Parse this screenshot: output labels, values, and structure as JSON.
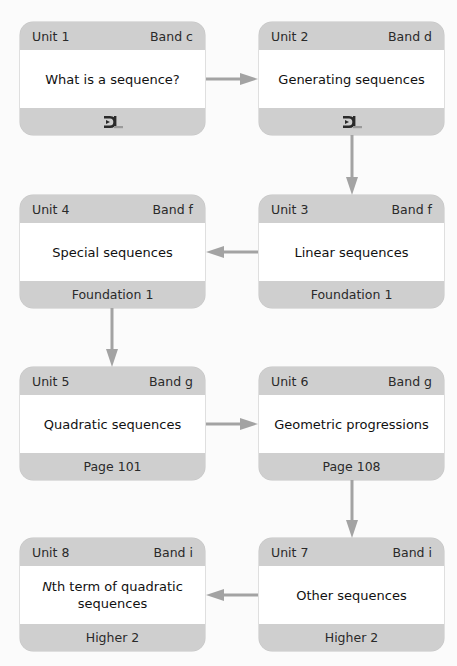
{
  "colors": {
    "box_band": "#cfcfcf",
    "box_body": "#ffffff",
    "arrow": "#a3a3a3",
    "background": "#fbfbfb"
  },
  "units": [
    {
      "unit": "Unit 1",
      "band": "Band c",
      "title": "What is a sequence?",
      "footer_icon": "dl-logo-icon"
    },
    {
      "unit": "Unit 2",
      "band": "Band d",
      "title": "Generating sequences",
      "footer_icon": "dl-logo-icon"
    },
    {
      "unit": "Unit 3",
      "band": "Band f",
      "title": "Linear sequences",
      "footer": "Foundation 1"
    },
    {
      "unit": "Unit 4",
      "band": "Band f",
      "title": "Special sequences",
      "footer": "Foundation 1"
    },
    {
      "unit": "Unit 5",
      "band": "Band g",
      "title": "Quadratic sequences",
      "footer": "Page 101"
    },
    {
      "unit": "Unit 6",
      "band": "Band g",
      "title": "Geometric progressions",
      "footer": "Page 108"
    },
    {
      "unit": "Unit 7",
      "band": "Band i",
      "title": "Other sequences",
      "footer": "Higher 2"
    },
    {
      "unit": "Unit 8",
      "band": "Band i",
      "title_italic": "N",
      "title_rest": "th term of quadratic sequences",
      "footer": "Higher 2"
    }
  ],
  "flow": [
    "Unit 1 → Unit 2",
    "Unit 2 → Unit 3",
    "Unit 3 → Unit 4",
    "Unit 4 → Unit 5",
    "Unit 5 → Unit 6",
    "Unit 6 → Unit 7",
    "Unit 7 → Unit 8"
  ]
}
